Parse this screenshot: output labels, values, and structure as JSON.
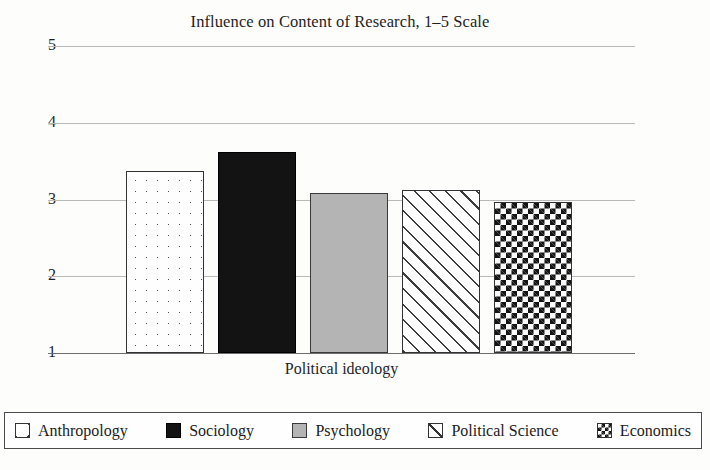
{
  "chart_data": {
    "type": "bar",
    "title": "Influence on Content of Research, 1–5 Scale",
    "xlabel": "Political ideology",
    "ylabel": "",
    "ylim": [
      1,
      5
    ],
    "yticks": [
      "5",
      "4",
      "3",
      "2",
      "1"
    ],
    "grid": true,
    "legend_position": "bottom",
    "categories": [
      "Anthropology",
      "Sociology",
      "Psychology",
      "Political Science",
      "Economics"
    ],
    "values": [
      3.37,
      3.62,
      3.08,
      3.13,
      2.97
    ],
    "series": [
      {
        "name": "Influence on Content of Research",
        "points": [
          {
            "category": "Anthropology",
            "value": 3.37,
            "pattern": "dotted"
          },
          {
            "category": "Sociology",
            "value": 3.62,
            "pattern": "solidblack"
          },
          {
            "category": "Psychology",
            "value": 3.08,
            "pattern": "solidgray"
          },
          {
            "category": "Political Science",
            "value": 3.13,
            "pattern": "diagonal"
          },
          {
            "category": "Economics",
            "value": 2.97,
            "pattern": "checker"
          }
        ]
      }
    ]
  },
  "legend": {
    "items": [
      {
        "label": "Anthropology",
        "pattern": "dotted"
      },
      {
        "label": "Sociology",
        "pattern": "solidblack"
      },
      {
        "label": "Psychology",
        "pattern": "solidgray"
      },
      {
        "label": "Political Science",
        "pattern": "diagonal"
      },
      {
        "label": "Economics",
        "pattern": "checker"
      }
    ]
  },
  "colors": {
    "background": "#fdfdfc",
    "gridline": "#b9b9b9",
    "baseline": "#6e6e6e",
    "text": "#1a1a1a",
    "bar_black": "#131313",
    "bar_gray": "#b4b4b4",
    "bar_outline": "#333333"
  }
}
